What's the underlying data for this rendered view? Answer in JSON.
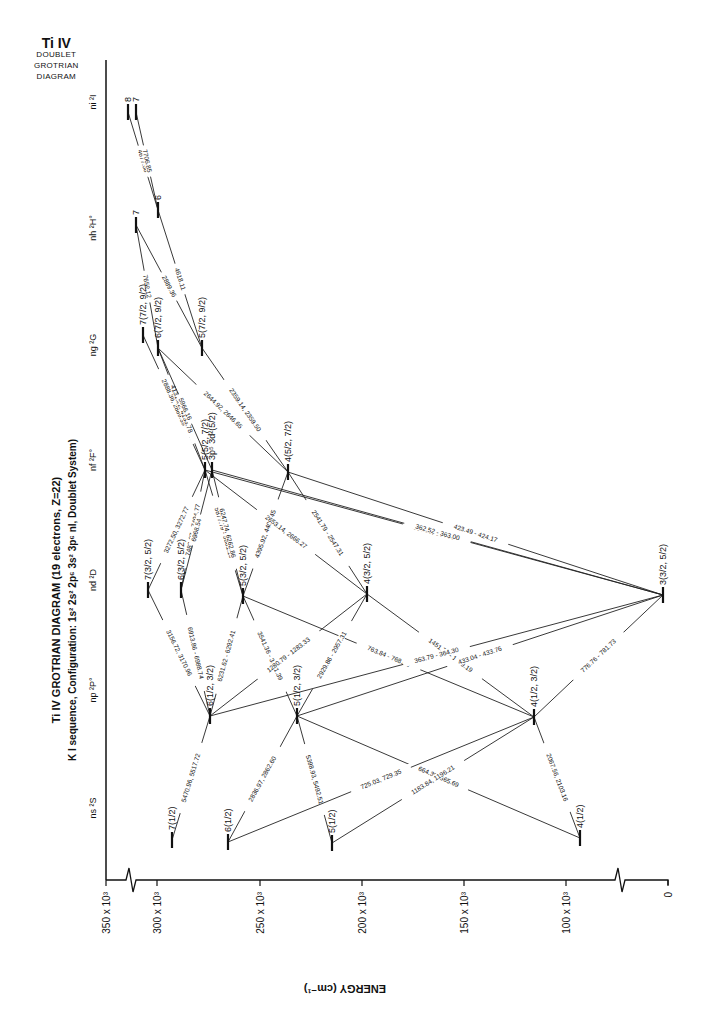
{
  "corner_title": {
    "ion": "Ti IV",
    "line1": "DOUBLET",
    "line2": "GROTRIAN",
    "line3": "DIAGRAM"
  },
  "title": {
    "main": "Ti IV GROTRIAN DIAGRAM (19 electrons, Z=22)",
    "sub": "K I sequence, Configuration: 1s² 2s² 2p⁶ 3s² 3p⁶ nl, Doublet System)"
  },
  "axis": {
    "label": "ENERGY (cm⁻¹)",
    "ticks": [
      {
        "label": "350 x 10³",
        "x": 106
      },
      {
        "label": "300 x 10³",
        "x": 157
      },
      {
        "label": "250 x 10³",
        "x": 260
      },
      {
        "label": "200 x 10³",
        "x": 362
      },
      {
        "label": "150 x 10³",
        "x": 464
      },
      {
        "label": "100 x 10³",
        "x": 566
      },
      {
        "label": "0",
        "x": 668
      }
    ]
  },
  "columns": [
    {
      "label": "ni ²I",
      "y": 102
    },
    {
      "label": "nh ²H°",
      "y": 228
    },
    {
      "label": "ng ²G",
      "y": 345
    },
    {
      "label": "nf ²F°",
      "y": 460
    },
    {
      "label": "nd ²D",
      "y": 580
    },
    {
      "label": "np ²P°",
      "y": 690
    },
    {
      "label": "ns ²S",
      "y": 808
    }
  ],
  "chart_data": {
    "type": "grotrian",
    "title": "Ti IV GROTRIAN DIAGRAM (19 electrons, Z=22)",
    "subtitle": "K I sequence, Configuration: 1s2 2s2 2p6 3s2 3p6 nl, Doublet System",
    "xlabel": "ENERGY (cm-1)",
    "xlim": [
      350000,
      0
    ],
    "levels": [
      {
        "id": "8I",
        "label": "8",
        "x": 128,
        "y": 112
      },
      {
        "id": "7I",
        "label": "7",
        "x": 136,
        "y": 112
      },
      {
        "id": "6H",
        "label": "6",
        "x": 158,
        "y": 210
      },
      {
        "id": "7H",
        "label": "7",
        "x": 136,
        "y": 225
      },
      {
        "id": "7G",
        "label": "7(7/2, 9/2)",
        "x": 143,
        "y": 335
      },
      {
        "id": "6G",
        "label": "6(7/2, 9/2)",
        "x": 158,
        "y": 348
      },
      {
        "id": "5G",
        "label": "5(7/2, 9/2)",
        "x": 202,
        "y": 348
      },
      {
        "id": "5F",
        "label": "5(5/2, 7/2)",
        "x": 205,
        "y": 470
      },
      {
        "id": "3p5F",
        "label": "3p⁵ 3d²(5/2)",
        "x": 212,
        "y": 470
      },
      {
        "id": "4F",
        "label": "4(5/2, 7/2)",
        "x": 288,
        "y": 472
      },
      {
        "id": "7D",
        "label": "7(3/2, 5/2)",
        "x": 148,
        "y": 590
      },
      {
        "id": "6D",
        "label": "6(3/2, 5/2)",
        "x": 181,
        "y": 590
      },
      {
        "id": "5D",
        "label": "5(3/2, 5/2)",
        "x": 243,
        "y": 596
      },
      {
        "id": "4D",
        "label": "4(3/2, 5/2)",
        "x": 367,
        "y": 594
      },
      {
        "id": "3D",
        "label": "3(3/2, 5/2)",
        "x": 663,
        "y": 595
      },
      {
        "id": "6P",
        "label": "6(1/2, 3/2)",
        "x": 210,
        "y": 716
      },
      {
        "id": "5P",
        "label": "5(1/2, 3/2)",
        "x": 297,
        "y": 716
      },
      {
        "id": "4P",
        "label": "4(1/2, 3/2)",
        "x": 534,
        "y": 717
      },
      {
        "id": "7S",
        "label": "7(1/2)",
        "x": 172,
        "y": 840
      },
      {
        "id": "6S",
        "label": "6(1/2)",
        "x": 228,
        "y": 842
      },
      {
        "id": "5S",
        "label": "5(1/2)",
        "x": 332,
        "y": 843
      },
      {
        "id": "4S",
        "label": "4(1/2)",
        "x": 580,
        "y": 838
      }
    ],
    "transitions": [
      {
        "from": "8I",
        "to": "6H",
        "label": "4677.58"
      },
      {
        "from": "7I",
        "to": "6H",
        "label": "7706.85"
      },
      {
        "from": "7H",
        "to": "6G",
        "label": "7652.12"
      },
      {
        "from": "7H",
        "to": "5G",
        "label": "2889.36"
      },
      {
        "from": "6H",
        "to": "5G",
        "label": "4618.11"
      },
      {
        "from": "7G",
        "to": "5F",
        "label": "2888.36, 2889.39"
      },
      {
        "from": "6G",
        "to": "5F",
        "label": "4131.22, 4133.78"
      },
      {
        "from": "6G",
        "to": "3p5F",
        "label": "5966.16"
      },
      {
        "from": "6G",
        "to": "4F",
        "label": "2644.92, 2646.65"
      },
      {
        "from": "5G",
        "to": "4F",
        "label": "2359.14, 2359.50"
      },
      {
        "from": "5F",
        "to": "7D",
        "label": "3272.50, 3272.77"
      },
      {
        "from": "5F",
        "to": "6D",
        "label": "7483.07 - 7494.77"
      },
      {
        "from": "3p5F",
        "to": "6D",
        "label": "6968.54"
      },
      {
        "from": "5F",
        "to": "5D",
        "label": "5877.79 - 5881.15"
      },
      {
        "from": "3p5F",
        "to": "5D",
        "label": "6247.74, 6262.86"
      },
      {
        "from": "4F",
        "to": "5D",
        "label": "4395.92, 4403.45"
      },
      {
        "from": "5F",
        "to": "4D",
        "label": "2653.14, 2666.27"
      },
      {
        "from": "4F",
        "to": "4D",
        "label": "2541.79 - 2547.31"
      },
      {
        "from": "4F",
        "to": "3D",
        "label": "423.49 - 424.17"
      },
      {
        "from": "5F",
        "to": "3D",
        "label": "363.85, 364.35"
      },
      {
        "from": "3p5F",
        "to": "3D",
        "label": "362.52 - 363.00"
      },
      {
        "from": "7D",
        "to": "6P",
        "label": "3156.72, 3170.96"
      },
      {
        "from": "6D",
        "to": "6P",
        "label": "6913.86 - 6988.74"
      },
      {
        "from": "5D",
        "to": "6P",
        "label": "6231.62 - 6292.41"
      },
      {
        "from": "5D",
        "to": "5P",
        "label": "3541.36 - 3581.39"
      },
      {
        "from": "5D",
        "to": "4P",
        "label": "763.84 - 768.65"
      },
      {
        "from": "4D",
        "to": "6P",
        "label": "1280.79 - 1283.33"
      },
      {
        "from": "4D",
        "to": "5P",
        "label": "2929.86 - 2957.31"
      },
      {
        "from": "4D",
        "to": "4P",
        "label": "1451.74 - 1469.19"
      },
      {
        "from": "3D",
        "to": "6P",
        "label": "363.79 - 364.30"
      },
      {
        "from": "3D",
        "to": "5P",
        "label": "433.04 - 433.76"
      },
      {
        "from": "3D",
        "to": "4P",
        "label": "776.76 - 781.73"
      },
      {
        "from": "6P",
        "to": "7S",
        "label": "5470.96, 5517.72"
      },
      {
        "from": "5P",
        "to": "6S",
        "label": "2836.97, 2862.60"
      },
      {
        "from": "5P",
        "to": "5S",
        "label": "5398.93, 5492.51"
      },
      {
        "from": "5P",
        "to": "4S",
        "label": "664.30, 665.69"
      },
      {
        "from": "4P",
        "to": "6S",
        "label": "725.03, 729.35"
      },
      {
        "from": "4P",
        "to": "5S",
        "label": "1183.84, 1196.21"
      },
      {
        "from": "4P",
        "to": "4S",
        "label": "2067.56, 2103.16"
      }
    ]
  }
}
